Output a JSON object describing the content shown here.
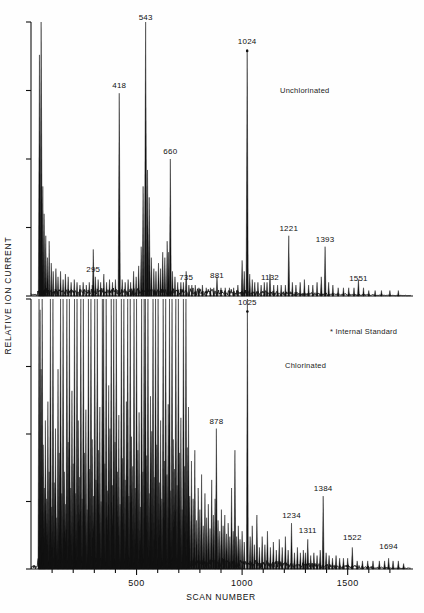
{
  "figure": {
    "y_axis_label": "RELATIVE ION CURRENT",
    "x_axis_label": "SCAN NUMBER",
    "footnote": "* Internal Standard",
    "ink_color": "#111111",
    "background_color": "#ffffff"
  },
  "panels": [
    {
      "id": "top",
      "name": "Unchlorinated"
    },
    {
      "id": "bottom",
      "name": "Chlorinated"
    }
  ],
  "chart_data": {
    "type": "line",
    "title": "",
    "subtitle": "",
    "xlabel": "SCAN NUMBER",
    "ylabel": "RELATIVE ION CURRENT",
    "xlim": [
      0,
      1800
    ],
    "ylim": [
      0,
      100
    ],
    "grid": false,
    "legend_position": "none",
    "xticks": [
      500,
      1000,
      1500
    ],
    "xtick_labels": [
      "500",
      "1000",
      "1500"
    ],
    "xminorticks": [
      100,
      200,
      300,
      400,
      600,
      700,
      800,
      900,
      1100,
      1200,
      1300,
      1400,
      1600,
      1700
    ],
    "annotations": [
      "Unchlorinated",
      "Chlorinated",
      "* Internal Standard"
    ],
    "series": [
      {
        "name": "Unchlorinated",
        "panel": "top",
        "labeled_peaks": [
          {
            "scan": 295,
            "label": "295",
            "height": 18
          },
          {
            "scan": 418,
            "label": "418",
            "height": 74
          },
          {
            "scan": 543,
            "label": "543",
            "height": 99
          },
          {
            "scan": 660,
            "label": "660",
            "height": 50
          },
          {
            "scan": 735,
            "label": "735",
            "height": 10
          },
          {
            "scan": 881,
            "label": "881",
            "height": 8
          },
          {
            "scan": 1024,
            "label": "1024",
            "height": 90,
            "internal_standard": true
          },
          {
            "scan": 1132,
            "label": "1132",
            "height": 9
          },
          {
            "scan": 1221,
            "label": "1221",
            "height": 22
          },
          {
            "scan": 1393,
            "label": "1393",
            "height": 18
          },
          {
            "scan": 1551,
            "label": "1551",
            "height": 7
          }
        ]
      },
      {
        "name": "Chlorinated",
        "panel": "bottom",
        "labeled_peaks": [
          {
            "scan": 878,
            "label": "878",
            "height": 52
          },
          {
            "scan": 1025,
            "label": "1025",
            "height": 99,
            "internal_standard": true
          },
          {
            "scan": 1234,
            "label": "1234",
            "height": 17
          },
          {
            "scan": 1311,
            "label": "1311",
            "height": 11
          },
          {
            "scan": 1384,
            "label": "1384",
            "height": 27
          },
          {
            "scan": 1522,
            "label": "1522",
            "height": 8
          },
          {
            "scan": 1694,
            "label": "1694",
            "height": 5
          }
        ]
      }
    ]
  }
}
